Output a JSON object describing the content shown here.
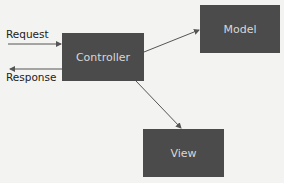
{
  "diagram": {
    "nodes": [
      {
        "id": "controller",
        "label": "Controller"
      },
      {
        "id": "model",
        "label": "Model"
      },
      {
        "id": "view",
        "label": "View"
      }
    ],
    "edge_labels": {
      "request": "Request",
      "response": "Response"
    },
    "edges": [
      {
        "from": "external",
        "to": "controller",
        "label": "Request"
      },
      {
        "from": "controller",
        "to": "external",
        "label": "Response"
      },
      {
        "from": "controller",
        "to": "model",
        "label": ""
      },
      {
        "from": "controller",
        "to": "view",
        "label": ""
      }
    ],
    "colors": {
      "background": "#f3f3f1",
      "box": "#4b4b4b",
      "box_text": "#d8d8d8",
      "arrow": "#555555"
    }
  }
}
